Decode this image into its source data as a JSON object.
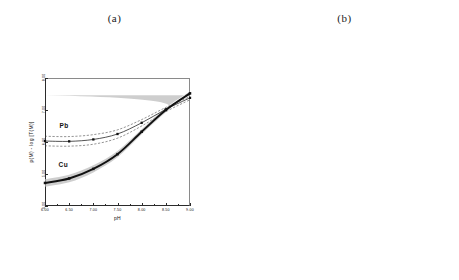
{
  "figure": {
    "panels": [
      {
        "caption": "(a)",
        "xlabel": "pH",
        "ylabel": "p(M)  -  log [T(M)]",
        "xticks": [
          "6.00",
          "6.50",
          "7.00",
          "7.50",
          "8.00",
          "8.50",
          "9.00"
        ],
        "yticks": [
          "4.00",
          "5.00",
          "6.00",
          "7.00",
          "8.00"
        ],
        "series_labels": [
          "Pb",
          "Cu"
        ]
      },
      {
        "caption": "(b)",
        "xlabel": "pH",
        "ylabel": "pM/pH Slope",
        "xticks": [
          "6.00",
          "6.50",
          "7.00",
          "7.50",
          "8.00",
          "8.50",
          "9.00"
        ],
        "yticks": [
          "0.00",
          "0.10",
          "0.20",
          "0.30",
          "0.40",
          "0.50",
          "0.60"
        ],
        "series_labels": [
          "Cu",
          "Pb"
        ]
      }
    ]
  },
  "chart_data": [
    {
      "type": "line",
      "title": "(a)",
      "xlabel": "pH",
      "ylabel": "p(M)  -  log [T(M)]",
      "xlim": [
        6.0,
        9.0
      ],
      "ylim": [
        4.0,
        8.0
      ],
      "grid": false,
      "legend": "inline-labels",
      "series": [
        {
          "name": "Pb",
          "style": "solid-thin-with-markers",
          "color": "#1a1a1a",
          "x": [
            6.0,
            6.5,
            7.0,
            7.5,
            8.0,
            8.5,
            9.0
          ],
          "y": [
            6.03,
            6.02,
            6.08,
            6.25,
            6.6,
            7.02,
            7.38
          ],
          "band_upper": [
            6.18,
            6.17,
            6.23,
            6.38,
            6.7,
            7.08,
            7.42
          ],
          "band_lower": [
            5.88,
            5.87,
            5.93,
            6.12,
            6.5,
            6.95,
            7.32
          ],
          "band_style": "dashed"
        },
        {
          "name": "Cu",
          "style": "solid-thick-with-markers",
          "color": "#111111",
          "x": [
            6.0,
            6.5,
            7.0,
            7.5,
            8.0,
            8.5,
            9.0
          ],
          "y": [
            4.72,
            4.86,
            5.16,
            5.62,
            6.32,
            7.0,
            7.52
          ],
          "band_upper": [
            4.84,
            4.98,
            5.27,
            5.72,
            6.4,
            7.07,
            7.58
          ],
          "band_lower": [
            4.6,
            4.74,
            5.05,
            5.52,
            6.24,
            6.93,
            7.46
          ],
          "band_style": "gray-shaded"
        }
      ]
    },
    {
      "type": "line",
      "title": "(b)",
      "xlabel": "pH",
      "ylabel": "pM/pH Slope",
      "xlim": [
        6.0,
        9.0
      ],
      "ylim": [
        0.0,
        0.6
      ],
      "grid": false,
      "legend": "inline-labels",
      "series": [
        {
          "name": "Cu",
          "style": "solid-with-markers",
          "color": "#1a1a1a",
          "x": [
            6.0,
            6.15,
            6.3,
            6.45,
            6.6,
            6.75,
            6.9,
            7.05,
            7.2,
            7.35,
            7.5,
            7.65,
            7.8,
            7.95,
            8.1,
            8.25,
            8.4,
            8.55,
            8.7,
            8.85,
            9.0
          ],
          "y": [
            0.035,
            0.095,
            0.15,
            0.196,
            0.236,
            0.272,
            0.306,
            0.338,
            0.37,
            0.401,
            0.432,
            0.461,
            0.485,
            0.503,
            0.513,
            0.514,
            0.505,
            0.487,
            0.459,
            0.422,
            0.38
          ]
        },
        {
          "name": "Pb",
          "style": "solid-with-markers",
          "color": "#1a1a1a",
          "x": [
            6.0,
            6.15,
            6.3,
            6.45,
            6.6,
            6.75,
            6.9,
            7.05,
            7.2,
            7.35,
            7.5,
            7.65,
            7.8,
            7.95,
            8.1,
            8.25,
            8.4,
            8.55,
            8.7,
            8.85,
            9.0
          ],
          "y": [
            0.018,
            0.021,
            0.026,
            0.033,
            0.042,
            0.053,
            0.068,
            0.088,
            0.114,
            0.146,
            0.182,
            0.22,
            0.257,
            0.29,
            0.316,
            0.333,
            0.34,
            0.336,
            0.322,
            0.3,
            0.272
          ]
        }
      ]
    }
  ]
}
